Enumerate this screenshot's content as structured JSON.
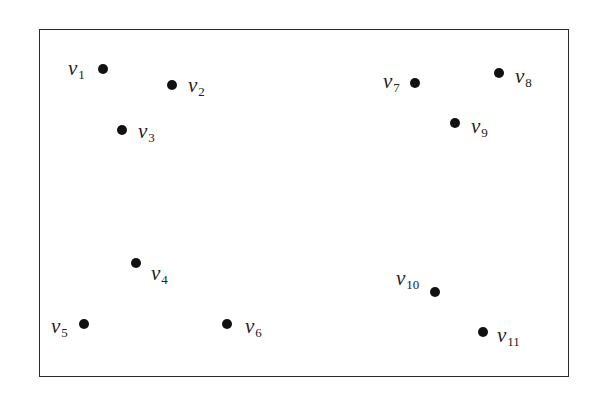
{
  "diagram": {
    "type": "point-set",
    "frame": {
      "left": 39,
      "top": 29,
      "right": 569,
      "bottom": 377
    },
    "vertices": [
      {
        "id": "v1",
        "name": "v",
        "sub": "1",
        "x": 103,
        "y": 69,
        "lx": 68,
        "ly": 58
      },
      {
        "id": "v2",
        "name": "v",
        "sub": "2",
        "x": 172,
        "y": 85,
        "lx": 188,
        "ly": 75
      },
      {
        "id": "v3",
        "name": "v",
        "sub": "3",
        "x": 122,
        "y": 130,
        "lx": 138,
        "ly": 121
      },
      {
        "id": "v4",
        "name": "v",
        "sub": "4",
        "x": 136,
        "y": 263,
        "lx": 151,
        "ly": 263
      },
      {
        "id": "v5",
        "name": "v",
        "sub": "5",
        "x": 84,
        "y": 324,
        "lx": 51,
        "ly": 316
      },
      {
        "id": "v6",
        "name": "v",
        "sub": "6",
        "x": 227,
        "y": 324,
        "lx": 245,
        "ly": 316
      },
      {
        "id": "v7",
        "name": "v",
        "sub": "7",
        "x": 415,
        "y": 83,
        "lx": 383,
        "ly": 71
      },
      {
        "id": "v8",
        "name": "v",
        "sub": "8",
        "x": 499,
        "y": 73,
        "lx": 515,
        "ly": 66
      },
      {
        "id": "v9",
        "name": "v",
        "sub": "9",
        "x": 455,
        "y": 123,
        "lx": 471,
        "ly": 116
      },
      {
        "id": "v10",
        "name": "v",
        "sub": "10",
        "x": 435,
        "y": 292,
        "lx": 396,
        "ly": 268
      },
      {
        "id": "v11",
        "name": "v",
        "sub": "11",
        "x": 483,
        "y": 332,
        "lx": 497,
        "ly": 325
      }
    ]
  }
}
